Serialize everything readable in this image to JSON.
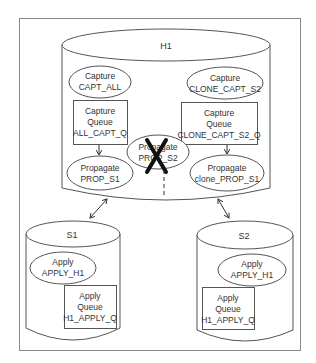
{
  "diagram": {
    "colors": {
      "stroke": "#555555",
      "frame": "#888888",
      "text": "#333333",
      "cross": "#111111"
    },
    "source_db": {
      "name": "H1",
      "capture_processes": [
        {
          "line1": "Capture",
          "line2": "CAPT_ALL"
        },
        {
          "line1": "Capture",
          "line2": "CLONE_CAPT_S2"
        }
      ],
      "capture_queues": [
        {
          "line1": "Capture",
          "line2": "Queue",
          "line3": "ALL_CAPT_Q"
        },
        {
          "line1": "Capture",
          "line2": "Queue",
          "line3": "CLONE_CAPT_S2_Q"
        }
      ],
      "propagations": [
        {
          "line1": "Propagate",
          "line2": "PROP_S1",
          "status": "active"
        },
        {
          "line1": "Propagate",
          "line2": "PROP_S2",
          "status": "disabled (crossed out)"
        },
        {
          "line1": "Propagate",
          "line2": "clone_PROP_S1",
          "status": "active"
        }
      ]
    },
    "targets": [
      {
        "name": "S1",
        "apply": {
          "line1": "Apply",
          "line2": "APPLY_H1"
        },
        "queue": {
          "line1": "Apply",
          "line2": "Queue",
          "line3": "H1_APPLY_Q"
        }
      },
      {
        "name": "S2",
        "apply": {
          "line1": "Apply",
          "line2": "APPLY_H1"
        },
        "queue": {
          "line1": "Apply",
          "line2": "Queue",
          "line3": "H1_APPLY_Q"
        }
      }
    ],
    "connections": [
      {
        "from": "ALL_CAPT_Q",
        "to": "PROP_S1",
        "style": "solid arrow"
      },
      {
        "from": "CLONE_CAPT_S2_Q",
        "to": "clone_PROP_S1",
        "style": "solid arrow"
      },
      {
        "from": "H1",
        "to": "S1",
        "style": "bidirectional arrow"
      },
      {
        "from": "H1",
        "to": "S2",
        "style": "bidirectional arrow"
      },
      {
        "from": "PROP_S2",
        "to": "H1 boundary",
        "style": "dashed line"
      }
    ]
  }
}
